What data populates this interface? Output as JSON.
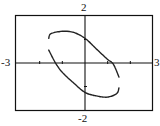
{
  "chart_data": {
    "type": "line",
    "title": "",
    "xlabel": "",
    "ylabel": "",
    "xlim": [
      -3,
      3
    ],
    "ylim": [
      -2,
      2
    ],
    "x_tick_step": 1,
    "y_tick_step": 1,
    "grid": false,
    "legend": null,
    "window_labels": {
      "xmin": "-3",
      "xmax": "3",
      "ymin": "-2",
      "ymax": "2"
    },
    "series": [
      {
        "name": "upper branch",
        "points": [
          [
            -1.6,
            1.05
          ],
          [
            -1.5,
            1.25
          ],
          [
            -1.0,
            1.35
          ],
          [
            -0.5,
            1.3
          ],
          [
            0.0,
            1.05
          ],
          [
            0.5,
            0.6
          ],
          [
            1.0,
            0.15
          ],
          [
            1.25,
            -0.05
          ],
          [
            1.5,
            -0.6
          ]
        ]
      },
      {
        "name": "lower branch",
        "points": [
          [
            -1.6,
            0.55
          ],
          [
            -1.3,
            0.0
          ],
          [
            -1.0,
            -0.4
          ],
          [
            -0.5,
            -0.85
          ],
          [
            0.0,
            -1.25
          ],
          [
            0.5,
            -1.4
          ],
          [
            1.0,
            -1.45
          ],
          [
            1.4,
            -1.3
          ],
          [
            1.5,
            -1.05
          ]
        ]
      }
    ]
  },
  "labels": {
    "top": "2",
    "bottom": "-2",
    "left": "-3",
    "right": "3"
  },
  "colors": {
    "curve": "#222222",
    "axes": "#111111",
    "frame": "#111111",
    "background": "#ffffff"
  }
}
